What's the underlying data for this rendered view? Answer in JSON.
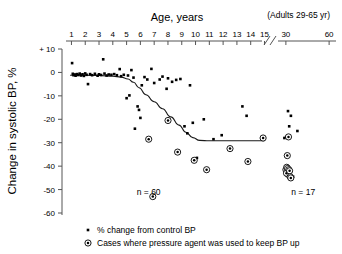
{
  "chart_data": {
    "type": "scatter",
    "title": "Age, years",
    "subtitle": "(Adults 29-65 yr)",
    "xlabel": "Age, years",
    "ylabel": "Change in systolic BP, %",
    "ylim": [
      -60,
      10
    ],
    "yticks": [
      "+ 10",
      "0",
      "-10",
      "-20",
      "-30",
      "-40",
      "-50",
      "-60"
    ],
    "ytick_values": [
      10,
      0,
      -10,
      -20,
      -30,
      -40,
      -50,
      -60
    ],
    "xticks_children": [
      "1",
      "2",
      "3",
      "4",
      "5",
      "6",
      "7",
      "8",
      "9",
      "10",
      "11",
      "12",
      "13",
      "14",
      "15"
    ],
    "xtick_children_values": [
      1,
      2,
      3,
      4,
      5,
      6,
      7,
      8,
      9,
      10,
      11,
      12,
      13,
      14,
      15
    ],
    "xticks_adults": [
      "30",
      "60"
    ],
    "xtick_adults_values": [
      30,
      60
    ],
    "axis_break": "//",
    "grid": false,
    "legend_position": "below-plot",
    "annotations": [
      {
        "text": "n = 60",
        "x": 6.6,
        "y": -52.5
      },
      {
        "text": "n = 17",
        "x": 42.0,
        "y": -52.5
      }
    ],
    "series": [
      {
        "name": "% change from control BP",
        "marker": "filled-square",
        "points": [
          [
            1.05,
            4.0
          ],
          [
            1.1,
            -0.6
          ],
          [
            1.15,
            -1.2
          ],
          [
            1.25,
            -0.9
          ],
          [
            1.3,
            -1.4
          ],
          [
            1.4,
            -0.7
          ],
          [
            1.5,
            -1.1
          ],
          [
            1.6,
            -0.5
          ],
          [
            1.7,
            -1.3
          ],
          [
            1.8,
            -0.8
          ],
          [
            1.9,
            -1.5
          ],
          [
            2.0,
            -0.4
          ],
          [
            2.1,
            -1.0
          ],
          [
            2.2,
            -5.0
          ],
          [
            2.35,
            -0.7
          ],
          [
            2.5,
            -1.2
          ],
          [
            2.7,
            -0.6
          ],
          [
            2.9,
            -1.4
          ],
          [
            3.0,
            -0.8
          ],
          [
            3.15,
            -1.1
          ],
          [
            3.3,
            5.6
          ],
          [
            3.4,
            -0.5
          ],
          [
            3.55,
            -1.3
          ],
          [
            3.7,
            -0.9
          ],
          [
            3.9,
            -1.0
          ],
          [
            4.1,
            -0.7
          ],
          [
            4.3,
            -1.2
          ],
          [
            4.5,
            1.4
          ],
          [
            4.6,
            -1.6
          ],
          [
            4.8,
            -1.0
          ],
          [
            5.0,
            -11.0
          ],
          [
            5.1,
            -1.3
          ],
          [
            5.2,
            -9.8
          ],
          [
            5.35,
            1.0
          ],
          [
            5.5,
            -2.2
          ],
          [
            5.6,
            -24.0
          ],
          [
            5.8,
            -14.5
          ],
          [
            5.9,
            -16.0
          ],
          [
            6.0,
            -19.4
          ],
          [
            6.1,
            -5.5
          ],
          [
            6.3,
            -2.0
          ],
          [
            6.5,
            -3.0
          ],
          [
            6.8,
            1.5
          ],
          [
            7.0,
            -4.5
          ],
          [
            7.4,
            -3.0
          ],
          [
            7.6,
            -1.8
          ],
          [
            7.9,
            -7.0
          ],
          [
            8.0,
            -2.5
          ],
          [
            8.3,
            -4.0
          ],
          [
            8.6,
            -3.2
          ],
          [
            8.9,
            -2.8
          ],
          [
            9.2,
            -23.0
          ],
          [
            9.4,
            -26.0
          ],
          [
            9.6,
            -5.5
          ],
          [
            9.8,
            -21.5
          ],
          [
            10.1,
            -36.5
          ],
          [
            10.6,
            -20.0
          ],
          [
            11.3,
            -28.5
          ],
          [
            11.9,
            -26.8
          ],
          [
            13.4,
            -14.5
          ],
          [
            13.7,
            -18.5
          ],
          [
            29.0,
            -28.0
          ],
          [
            30.2,
            -27.5
          ],
          [
            30.4,
            -41.0
          ],
          [
            31.5,
            -16.5
          ],
          [
            32.3,
            -23.0
          ],
          [
            33.5,
            -18.5
          ],
          [
            35.0,
            -44.5
          ],
          [
            38.0,
            -25.0
          ]
        ]
      },
      {
        "name": "Cases where pressure agent was used to keep BP up",
        "marker": "circled-dot",
        "points": [
          [
            6.6,
            -28.5
          ],
          [
            6.9,
            -53.0
          ],
          [
            8.0,
            -20.5
          ],
          [
            8.7,
            -34.0
          ],
          [
            9.9,
            -37.5
          ],
          [
            10.8,
            -41.5
          ],
          [
            12.5,
            -32.5
          ],
          [
            13.8,
            -38.0
          ],
          [
            14.9,
            -28.0
          ],
          [
            30.0,
            -41.5
          ],
          [
            30.6,
            -40.5
          ],
          [
            31.0,
            -35.5
          ],
          [
            31.2,
            -41.0
          ],
          [
            31.4,
            -43.5
          ],
          [
            30.4,
            -43.0
          ],
          [
            32.0,
            -41.5
          ],
          [
            32.6,
            -42.0
          ],
          [
            33.0,
            -44.5
          ],
          [
            33.4,
            -45.0
          ],
          [
            31.8,
            -27.5
          ]
        ]
      }
    ],
    "fitted_curve": [
      [
        0.9,
        -1.2
      ],
      [
        2.0,
        -1.2
      ],
      [
        3.0,
        -1.3
      ],
      [
        4.0,
        -1.6
      ],
      [
        4.6,
        -2.0
      ],
      [
        5.1,
        -2.8
      ],
      [
        5.5,
        -4.2
      ],
      [
        5.9,
        -6.5
      ],
      [
        6.4,
        -9.5
      ],
      [
        7.0,
        -12.5
      ],
      [
        7.6,
        -15.5
      ],
      [
        8.2,
        -19.0
      ],
      [
        8.8,
        -22.5
      ],
      [
        9.3,
        -25.5
      ],
      [
        9.8,
        -27.8
      ],
      [
        10.3,
        -29.0
      ],
      [
        11.0,
        -29.2
      ],
      [
        12.5,
        -29.2
      ],
      [
        15.0,
        -29.2
      ]
    ]
  },
  "legend": {
    "items": [
      {
        "marker": "filled-square",
        "label": "% change from control BP"
      },
      {
        "marker": "circled-dot",
        "label": "Cases where pressure agent was used to keep BP up"
      }
    ]
  },
  "colors": {
    "foreground": "#000000",
    "background": "#ffffff",
    "curve": "#1a1a1a"
  }
}
